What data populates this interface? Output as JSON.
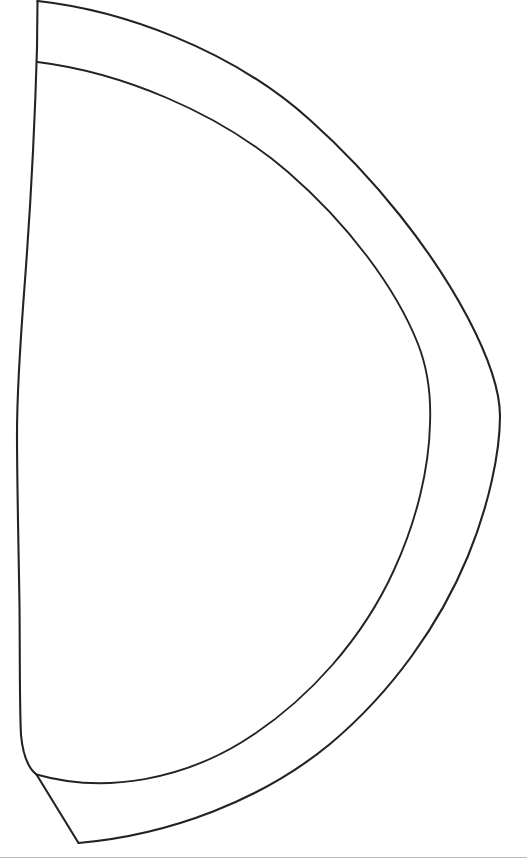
{
  "document": {
    "title": "Pattern Piece Line Drawing",
    "type": "technical-line-drawing",
    "subject": "half-oval garment pattern panel with seam allowance band",
    "background_color": "#ffffff",
    "ink_color": "#232323",
    "scan_edge_color": "#b9b9ba",
    "width_px": 527,
    "height_px": 865,
    "text_content": "",
    "labels": [],
    "annotations": []
  },
  "geometry": {
    "stroke_width_px": 2.1,
    "shapes": [
      {
        "name": "outer-contour",
        "description": "Outermost seam-allowance curve sweeping from the top-left corner rightward to the widest point and back down to the bottom point.",
        "path": "M 37.5 1 C 120 10, 230 48, 310 120 C 375 178, 432 250, 468 318 C 490 360, 500 392, 500 416 C 500 452, 489 505, 468 556 C 440 624, 392 692, 330 744 C 262 800, 170 835, 78.5 843"
      },
      {
        "name": "inner-contour",
        "description": "Inner panel curve (stitch line) running parallel inside the outer contour from the left edge at y=62 to the bottom-left junction at y=774.",
        "path": "M 37.5 62 C 118 72, 216 110, 288 172 C 348 224, 396 288, 418 344 C 429 372, 431 400, 430 424 C 429 468, 417 520, 394 570 C 364 636, 310 700, 242 742 C 185 777, 108 795, 36.5 774.5"
      },
      {
        "name": "left-edge",
        "description": "Left side of the panel: near-vertical, bowing slightly left through the middle then returning right at the bottom.",
        "path": "M 37.5 1 L 37 48 C 35 120, 31 200, 25 280 C 20 345, 17 400, 17 434 C 17 480, 18.5 545, 19.5 605 C 20 660, 19.5 706, 21 735 C 23 756, 28 768, 36.5 774.5"
      },
      {
        "name": "bottom-closure-edge",
        "description": "Short straight edge from the left-edge/inner-curve junction down-right to the bottom vertex of the outer contour.",
        "path": "M 36.5 774.5 L 78.5 843"
      },
      {
        "name": "scan-bottom-rule",
        "description": "Faint horizontal gray scanner edge line near the bottom of the page.",
        "path": "M 0 857.5 L 527 857.5"
      }
    ],
    "key_points": [
      {
        "name": "top-left-corner",
        "x": 37,
        "y": 1
      },
      {
        "name": "inner-curve-origin",
        "x": 37,
        "y": 62
      },
      {
        "name": "left-edge-widest-left",
        "x": 17,
        "y": 434
      },
      {
        "name": "outer-curve-rightmost",
        "x": 500,
        "y": 416
      },
      {
        "name": "inner-curve-rightmost",
        "x": 430,
        "y": 424
      },
      {
        "name": "bottom-left-junction",
        "x": 36,
        "y": 774
      },
      {
        "name": "bottom-vertex",
        "x": 78,
        "y": 843
      }
    ]
  }
}
